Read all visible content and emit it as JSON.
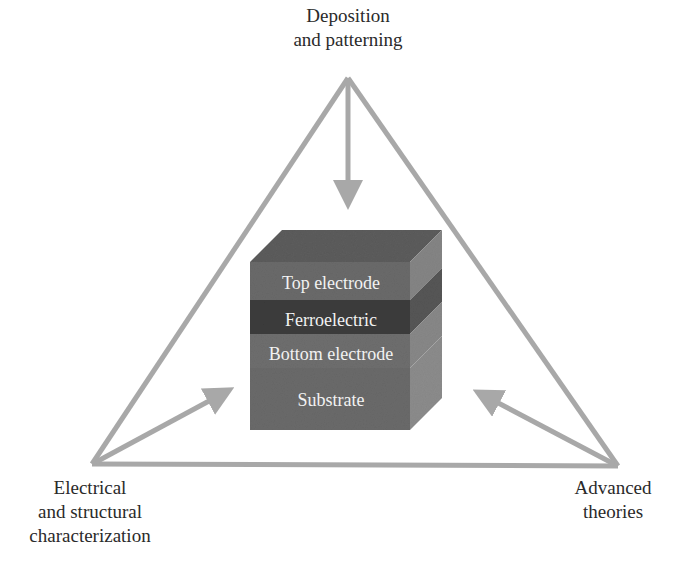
{
  "diagram": {
    "type": "triangle-cycle",
    "colors": {
      "arrow": "#a8a8a8",
      "text": "#2a2a2a",
      "layer_text": "#f2f2f2",
      "top_electrode_front": "#6a6a6a",
      "top_electrode_top": "#5c5c5c",
      "top_electrode_side": "#8a8a8a",
      "ferroelectric_front": "#3e3e3e",
      "ferroelectric_side": "#5a5a5a",
      "bottom_electrode_front": "#6e6e6e",
      "substrate_front": "#6a6a6a",
      "substrate_side": "#8e8e8e"
    },
    "vertices": {
      "top": {
        "lines": [
          "Deposition",
          "and patterning"
        ]
      },
      "bottom_left": {
        "lines": [
          "Electrical",
          "and structural",
          "characterization"
        ]
      },
      "bottom_right": {
        "lines": [
          "Advanced",
          "theories"
        ]
      }
    },
    "stack": {
      "layers": [
        {
          "label": "Top electrode"
        },
        {
          "label": "Ferroelectric"
        },
        {
          "label": "Bottom electrode"
        },
        {
          "label": "Substrate"
        }
      ]
    }
  }
}
